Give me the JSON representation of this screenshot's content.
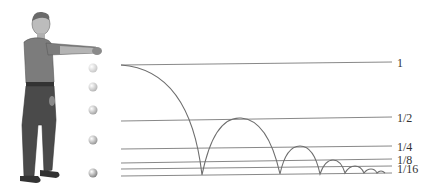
{
  "diagram": {
    "labels": [
      {
        "text": "1",
        "x": 397,
        "y": 57
      },
      {
        "text": "1/2",
        "x": 397,
        "y": 112
      },
      {
        "text": "1/4",
        "x": 397,
        "y": 141
      },
      {
        "text": "1/8",
        "x": 397,
        "y": 154
      },
      {
        "text": "1/16",
        "x": 397,
        "y": 163
      }
    ],
    "colors": {
      "line": "#7a7a7a",
      "curve": "#6e6e6e",
      "text": "#333333",
      "shirt": "#7c7c7c",
      "pants": "#4a4a4a",
      "skin": "#b9b9b9"
    },
    "balls": [
      {
        "cx": 93,
        "cy": 68,
        "shade": "#e6e6e6"
      },
      {
        "cx": 93,
        "cy": 87,
        "shade": "#d6d6d6"
      },
      {
        "cx": 93,
        "cy": 110,
        "shade": "#bdbdbd"
      },
      {
        "cx": 93,
        "cy": 140,
        "shade": "#a8a8a8"
      },
      {
        "cx": 93,
        "cy": 173,
        "shade": "#8e8e8e"
      }
    ]
  }
}
